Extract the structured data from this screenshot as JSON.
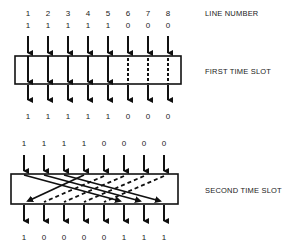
{
  "labels": {
    "line_number": "LINE NUMBER",
    "first_slot": "FIRST TIME SLOT",
    "second_slot": "SECOND TIME SLOT"
  },
  "line_numbers": [
    "1",
    "2",
    "3",
    "4",
    "5",
    "6",
    "7",
    "8"
  ],
  "first_slot": {
    "inputs": [
      "1",
      "1",
      "1",
      "1",
      "1",
      "0",
      "0",
      "0"
    ],
    "outputs": [
      "1",
      "1",
      "1",
      "1",
      "1",
      "0",
      "0",
      "0"
    ],
    "paths": [
      {
        "from": 1,
        "to": 1,
        "style": "solid"
      },
      {
        "from": 2,
        "to": 2,
        "style": "solid"
      },
      {
        "from": 3,
        "to": 3,
        "style": "solid"
      },
      {
        "from": 4,
        "to": 4,
        "style": "solid"
      },
      {
        "from": 5,
        "to": 5,
        "style": "solid"
      },
      {
        "from": 6,
        "to": 6,
        "style": "dashed"
      },
      {
        "from": 7,
        "to": 7,
        "style": "dashed"
      },
      {
        "from": 8,
        "to": 8,
        "style": "dashed"
      }
    ]
  },
  "second_slot": {
    "inputs": [
      "1",
      "1",
      "1",
      "1",
      "0",
      "0",
      "0",
      "0"
    ],
    "outputs": [
      "1",
      "0",
      "0",
      "0",
      "0",
      "1",
      "1",
      "1"
    ],
    "paths": [
      {
        "from": 1,
        "to": 6,
        "style": "solid"
      },
      {
        "from": 2,
        "to": 7,
        "style": "solid"
      },
      {
        "from": 3,
        "to": 8,
        "style": "solid"
      },
      {
        "from": 4,
        "to": 1,
        "style": "solid"
      },
      {
        "from": 5,
        "to": 2,
        "style": "dashed"
      },
      {
        "from": 6,
        "to": 3,
        "style": "dashed"
      },
      {
        "from": 7,
        "to": 4,
        "style": "dashed"
      },
      {
        "from": 8,
        "to": 5,
        "style": "dashed"
      }
    ]
  }
}
